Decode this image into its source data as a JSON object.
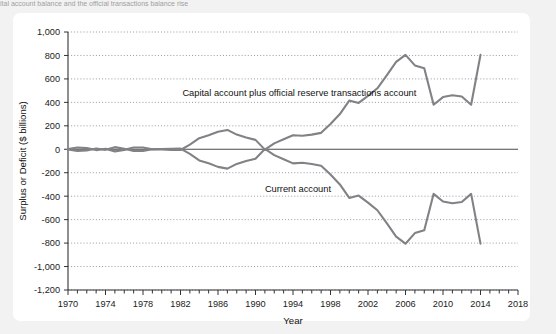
{
  "caption": {
    "text": "ital account balance and the official transactions balance rise"
  },
  "card": {
    "background": "#ffffff"
  },
  "chart_data": {
    "type": "line",
    "title": "",
    "xlabel": "Year",
    "ylabel": "Surplus or Deficit ($ billions)",
    "xlim": [
      1970,
      2018
    ],
    "ylim": [
      -1200,
      1000
    ],
    "grid": true,
    "grid_style": "dotted-horizontal",
    "legend_position": "inline-annotation",
    "line_color": "#808285",
    "x_ticks": [
      1970,
      1974,
      1978,
      1982,
      1986,
      1990,
      1994,
      1998,
      2002,
      2006,
      2010,
      2014,
      2018
    ],
    "x_tick_labels": [
      "1970",
      "1974",
      "1978",
      "1982",
      "1986",
      "1990",
      "1994",
      "1998",
      "2002",
      "2006",
      "2010",
      "2014",
      "2018"
    ],
    "x_minor_tick_step": 1,
    "y_ticks": [
      1000,
      800,
      600,
      400,
      200,
      0,
      -200,
      -400,
      -600,
      -800,
      -1000,
      -1200
    ],
    "y_tick_labels": [
      "1,000",
      "800",
      "600",
      "400",
      "200",
      "0",
      "-200",
      "-400",
      "-600",
      "-800",
      "-1,000",
      "-1,200"
    ],
    "x": [
      1970,
      1971,
      1972,
      1973,
      1974,
      1975,
      1976,
      1977,
      1978,
      1979,
      1980,
      1981,
      1982,
      1983,
      1984,
      1985,
      1986,
      1987,
      1988,
      1989,
      1990,
      1991,
      1992,
      1993,
      1994,
      1995,
      1996,
      1997,
      1998,
      1999,
      2000,
      2001,
      2002,
      2003,
      2004,
      2005,
      2006,
      2007,
      2008,
      2009,
      2010,
      2011,
      2012,
      2013,
      2014
    ],
    "series": [
      {
        "name": "Capital account plus official reserve transactions account",
        "label_text": "Capital account plus official reserve transactions account",
        "color": "#808285",
        "values": [
          2,
          15,
          10,
          -7,
          5,
          -18,
          -5,
          15,
          15,
          -1,
          -2,
          -5,
          -6,
          40,
          95,
          120,
          150,
          165,
          125,
          100,
          80,
          -3,
          50,
          85,
          120,
          115,
          125,
          140,
          215,
          300,
          415,
          395,
          455,
          520,
          630,
          745,
          805,
          715,
          690,
          380,
          445,
          460,
          450,
          380,
          805
        ]
      },
      {
        "name": "Current account",
        "label_text": "Current account",
        "color": "#808285",
        "values": [
          -2,
          -15,
          -10,
          7,
          -5,
          18,
          5,
          -15,
          -15,
          1,
          2,
          5,
          6,
          -40,
          -95,
          -120,
          -150,
          -165,
          -125,
          -100,
          -80,
          3,
          -50,
          -85,
          -120,
          -115,
          -125,
          -140,
          -215,
          -300,
          -415,
          -395,
          -455,
          -520,
          -630,
          -745,
          -805,
          -715,
          -690,
          -380,
          -445,
          -460,
          -450,
          -380,
          -805
        ]
      }
    ],
    "annotations": [
      {
        "name": "capital-account-label",
        "text": "Capital account plus official reserve transactions account",
        "x": 1982.2,
        "y": 480
      },
      {
        "name": "current-account-label",
        "text": "Current account",
        "x": 1991.0,
        "y": -335
      }
    ]
  }
}
